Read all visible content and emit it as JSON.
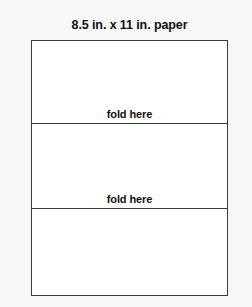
{
  "figure": {
    "caption": "8.5 in. x 11 in. paper",
    "sheet": {
      "panels": [
        {
          "id": "top",
          "fold_label": "fold here"
        },
        {
          "id": "middle",
          "fold_label": "fold here"
        },
        {
          "id": "bottom",
          "fold_label": ""
        }
      ]
    },
    "colors": {
      "background": "#f7f7f7",
      "paper": "#ffffff",
      "line": "#3a3a3a",
      "text": "#111111"
    }
  }
}
